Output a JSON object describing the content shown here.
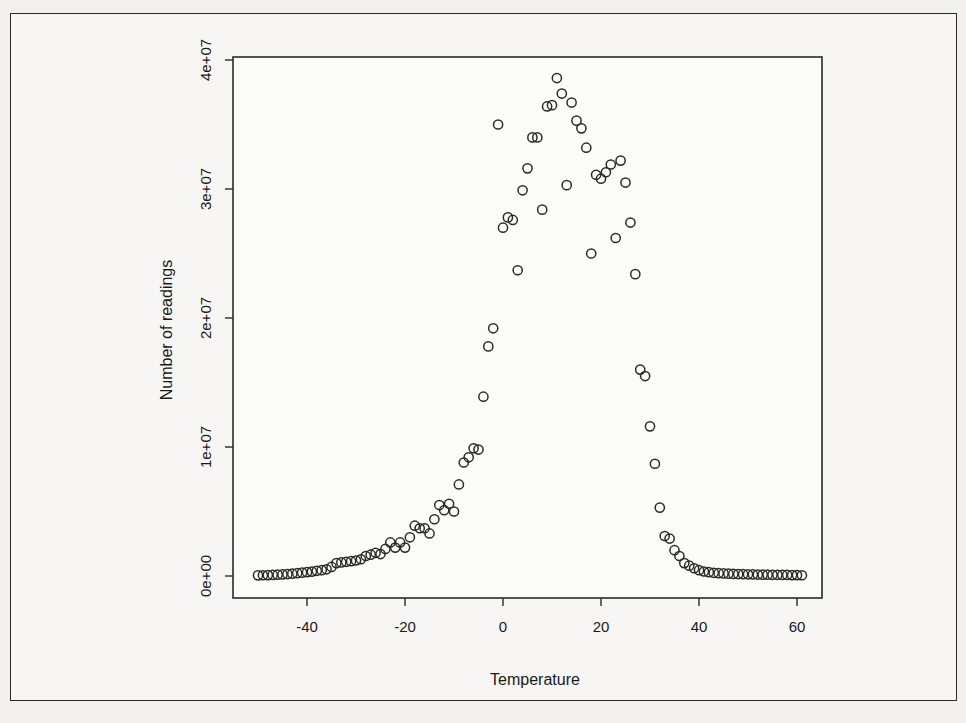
{
  "chart_data": {
    "type": "scatter",
    "title": "",
    "xlabel": "Temperature",
    "ylabel": "Number of readings",
    "xlim": [
      -52,
      63
    ],
    "ylim": [
      -1000000,
      41000000
    ],
    "grid": false,
    "legend": null,
    "x_ticks": [
      -40,
      -20,
      0,
      20,
      40,
      60
    ],
    "x_tick_labels": [
      "-40",
      "-20",
      "0",
      "20",
      "40",
      "60"
    ],
    "y_ticks": [
      0,
      10000000,
      20000000,
      30000000,
      40000000
    ],
    "y_tick_labels": [
      "0e+00",
      "1e+07",
      "2e+07",
      "3e+07",
      "4e+07"
    ],
    "marker": "open-circle",
    "points": [
      [
        -50,
        50000
      ],
      [
        -49,
        60000
      ],
      [
        -48,
        70000
      ],
      [
        -47,
        80000
      ],
      [
        -46,
        100000
      ],
      [
        -45,
        120000
      ],
      [
        -44,
        150000
      ],
      [
        -43,
        180000
      ],
      [
        -42,
        220000
      ],
      [
        -41,
        260000
      ],
      [
        -40,
        300000
      ],
      [
        -39,
        340000
      ],
      [
        -38,
        400000
      ],
      [
        -37,
        450000
      ],
      [
        -36,
        520000
      ],
      [
        -35,
        700000
      ],
      [
        -34,
        1000000
      ],
      [
        -33,
        1050000
      ],
      [
        -32,
        1100000
      ],
      [
        -31,
        1150000
      ],
      [
        -30,
        1200000
      ],
      [
        -29,
        1300000
      ],
      [
        -28,
        1550000
      ],
      [
        -27,
        1650000
      ],
      [
        -26,
        1800000
      ],
      [
        -25,
        1700000
      ],
      [
        -24,
        2100000
      ],
      [
        -23,
        2600000
      ],
      [
        -22,
        2200000
      ],
      [
        -21,
        2600000
      ],
      [
        -20,
        2200000
      ],
      [
        -19,
        3000000
      ],
      [
        -18,
        3900000
      ],
      [
        -17,
        3700000
      ],
      [
        -16,
        3700000
      ],
      [
        -15,
        3300000
      ],
      [
        -14,
        4400000
      ],
      [
        -13,
        5500000
      ],
      [
        -12,
        5100000
      ],
      [
        -11,
        5600000
      ],
      [
        -10,
        5000000
      ],
      [
        -9,
        7100000
      ],
      [
        -8,
        8800000
      ],
      [
        -7,
        9200000
      ],
      [
        -6,
        9900000
      ],
      [
        -5,
        9800000
      ],
      [
        -4,
        13900000
      ],
      [
        -3,
        17800000
      ],
      [
        -2,
        19200000
      ],
      [
        -1,
        35000000
      ],
      [
        0,
        27000000
      ],
      [
        1,
        27800000
      ],
      [
        2,
        27600000
      ],
      [
        3,
        23700000
      ],
      [
        4,
        29900000
      ],
      [
        5,
        31600000
      ],
      [
        6,
        34000000
      ],
      [
        7,
        34000000
      ],
      [
        8,
        28400000
      ],
      [
        9,
        36400000
      ],
      [
        10,
        36500000
      ],
      [
        11,
        38600000
      ],
      [
        12,
        37400000
      ],
      [
        13,
        30300000
      ],
      [
        14,
        36700000
      ],
      [
        15,
        35300000
      ],
      [
        16,
        34700000
      ],
      [
        17,
        33200000
      ],
      [
        18,
        25000000
      ],
      [
        19,
        31100000
      ],
      [
        20,
        30800000
      ],
      [
        21,
        31300000
      ],
      [
        22,
        31900000
      ],
      [
        23,
        26200000
      ],
      [
        24,
        32200000
      ],
      [
        25,
        30500000
      ],
      [
        26,
        27400000
      ],
      [
        27,
        23400000
      ],
      [
        28,
        16000000
      ],
      [
        29,
        15500000
      ],
      [
        30,
        11600000
      ],
      [
        31,
        8700000
      ],
      [
        32,
        5300000
      ],
      [
        33,
        3100000
      ],
      [
        34,
        2900000
      ],
      [
        35,
        2000000
      ],
      [
        36,
        1550000
      ],
      [
        37,
        1000000
      ],
      [
        38,
        800000
      ],
      [
        39,
        600000
      ],
      [
        40,
        450000
      ],
      [
        41,
        350000
      ],
      [
        42,
        300000
      ],
      [
        43,
        250000
      ],
      [
        44,
        220000
      ],
      [
        45,
        200000
      ],
      [
        46,
        180000
      ],
      [
        47,
        160000
      ],
      [
        48,
        150000
      ],
      [
        49,
        140000
      ],
      [
        50,
        130000
      ],
      [
        51,
        120000
      ],
      [
        52,
        110000
      ],
      [
        53,
        100000
      ],
      [
        54,
        100000
      ],
      [
        55,
        90000
      ],
      [
        56,
        90000
      ],
      [
        57,
        80000
      ],
      [
        58,
        80000
      ],
      [
        59,
        70000
      ],
      [
        60,
        70000
      ],
      [
        61,
        60000
      ]
    ]
  },
  "labels": {
    "xlabel": "Temperature",
    "ylabel": "Number of readings"
  }
}
